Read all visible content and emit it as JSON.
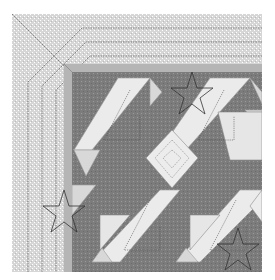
{
  "image": {
    "subject": "quilt corner pattern illustration",
    "colors": {
      "background": "#ffffff",
      "border_fabric": "#d4d4d4",
      "inner_strip": "#b8b8b8",
      "dark_fabric": "#7a7a7a",
      "light_fabric": "#ececec",
      "mid_fabric": "#cfcfcf",
      "quilting_line": "#555555",
      "star_line": "#333333"
    },
    "quilt_bounds": {
      "x": 12,
      "y": 14,
      "right": 262,
      "bottom": 272
    },
    "border": {
      "outer": 12,
      "inner_strip_start": 64,
      "inner_strip_end": 72
    },
    "motifs": [
      {
        "type": "star",
        "cx": 192,
        "cy": 92,
        "r": 20
      },
      {
        "type": "star",
        "cx": 64,
        "cy": 210,
        "r": 20
      },
      {
        "type": "star",
        "cx": 238,
        "cy": 248,
        "r": 20
      }
    ]
  }
}
